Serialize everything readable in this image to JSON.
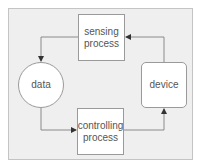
{
  "diagram": {
    "type": "cycle-flowchart",
    "nodes": [
      {
        "id": "sensing",
        "label": "sensing process",
        "lines": [
          "sensing",
          "process"
        ],
        "shape": "rectangle"
      },
      {
        "id": "data",
        "label": "data",
        "lines": [
          "data"
        ],
        "shape": "circle"
      },
      {
        "id": "controlling",
        "label": "controlling process",
        "lines": [
          "controlling",
          "process"
        ],
        "shape": "rectangle"
      },
      {
        "id": "device",
        "label": "device",
        "lines": [
          "device"
        ],
        "shape": "rounded-rectangle"
      }
    ],
    "edges": [
      {
        "from": "sensing",
        "to": "data"
      },
      {
        "from": "data",
        "to": "controlling"
      },
      {
        "from": "controlling",
        "to": "device"
      },
      {
        "from": "device",
        "to": "sensing"
      }
    ],
    "colors": {
      "panel_background": "#efefef",
      "node_fill": "#ffffff",
      "node_border": "#9a9a9a",
      "connector": "#8a8a8a",
      "arrowhead": "#333333",
      "text": "#555555"
    }
  }
}
